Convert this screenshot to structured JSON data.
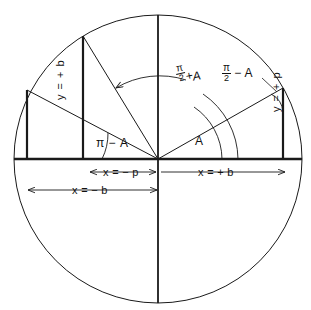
{
  "figure": {
    "type": "geometry-diagram",
    "stroke_color": "#1a1a1a",
    "background": "#ffffff",
    "circle": {
      "cx": 158,
      "cy": 159,
      "r": 144
    },
    "origin": {
      "x": 158,
      "y": 159
    },
    "points": {
      "right_ray_tip": {
        "x": 283,
        "y": 88
      },
      "steep_left_ray_tip": {
        "x": 83,
        "y": 36
      },
      "shallow_left_ray_tip": {
        "x": 27,
        "y": 90
      }
    }
  },
  "labels": {
    "angle_pi_minus_a": "π − A",
    "angle_a": "A",
    "angle_halfpi_plus_a": {
      "pi": "π",
      "two": "2",
      "op": "+",
      "var": "A"
    },
    "angle_halfpi_minus_a": {
      "pi": "π",
      "two": "2",
      "op": "−",
      "var": "A"
    },
    "y_left": "y = + b",
    "y_right": "y = + p",
    "x_minus_p": "x = − p",
    "x_plus_b": "x = + b",
    "x_minus_b": "x = − b"
  }
}
